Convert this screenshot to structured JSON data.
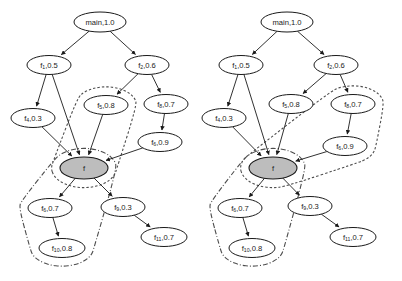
{
  "figure": {
    "type": "call-graph-diagram",
    "background_color": "#ffffff",
    "edge_color": "#1a1a1a",
    "node_fill": "#ffffff",
    "node_stroke": "#1a1a1a",
    "highlight_node_fill": "#bdbdbd",
    "contour_color": "#4d4d4d",
    "panels": [
      {
        "id": "left-panel",
        "name": "left-call-graph",
        "nodes": [
          {
            "id": "main",
            "label": "main,1.0",
            "base": "main",
            "sub": "",
            "value": "1.0",
            "cx": 100,
            "cy": 22,
            "rx": 26,
            "ry": 10,
            "shaded": false
          },
          {
            "id": "f1",
            "label": "f1,0.5",
            "base": "f",
            "sub": "1",
            "value": "0.5",
            "cx": 49,
            "cy": 65,
            "rx": 22,
            "ry": 9.5,
            "shaded": false
          },
          {
            "id": "f2",
            "label": "f2,0.6",
            "base": "f",
            "sub": "2",
            "value": "0.6",
            "cx": 147,
            "cy": 65,
            "rx": 22,
            "ry": 9.5,
            "shaded": false
          },
          {
            "id": "f4",
            "label": "f4,0.3",
            "base": "f",
            "sub": "4",
            "value": "0.3",
            "cx": 33,
            "cy": 118,
            "rx": 22,
            "ry": 9.5,
            "shaded": false
          },
          {
            "id": "f5",
            "label": "f5,0.8",
            "base": "f",
            "sub": "5",
            "value": "0.8",
            "cx": 106,
            "cy": 105,
            "rx": 22,
            "ry": 9.5,
            "shaded": false
          },
          {
            "id": "f8",
            "label": "f8,0.7",
            "base": "f",
            "sub": "8",
            "value": "0.7",
            "cx": 166,
            "cy": 104,
            "rx": 22,
            "ry": 9.5,
            "shaded": false
          },
          {
            "id": "f6",
            "label": "f6,0.9",
            "base": "f",
            "sub": "6",
            "value": "0.9",
            "cx": 160,
            "cy": 142,
            "rx": 22,
            "ry": 9.5,
            "shaded": false
          },
          {
            "id": "f",
            "label": "f",
            "base": "f",
            "sub": "",
            "value": "",
            "cx": 84,
            "cy": 168,
            "rx": 24,
            "ry": 11,
            "shaded": true
          },
          {
            "id": "f6b",
            "label": "f6,0.7",
            "base": "f",
            "sub": "6",
            "value": "0.7",
            "cx": 50,
            "cy": 208,
            "rx": 22,
            "ry": 9.5,
            "shaded": false
          },
          {
            "id": "f9",
            "label": "f9,0.3",
            "base": "f",
            "sub": "9",
            "value": "0.3",
            "cx": 123,
            "cy": 207,
            "rx": 22,
            "ry": 9.5,
            "shaded": false
          },
          {
            "id": "f10",
            "label": "f10,0.8",
            "base": "f",
            "sub": "10",
            "value": "0.8",
            "cx": 62,
            "cy": 248,
            "rx": 23,
            "ry": 9.5,
            "shaded": false
          },
          {
            "id": "f11",
            "label": "f11,0.7",
            "base": "f",
            "sub": "11",
            "value": "0.7",
            "cx": 164,
            "cy": 237,
            "rx": 23,
            "ry": 9.5,
            "shaded": false
          }
        ],
        "edges": [
          {
            "from": "main",
            "to": "f1"
          },
          {
            "from": "main",
            "to": "f2"
          },
          {
            "from": "f1",
            "to": "f4"
          },
          {
            "from": "f1",
            "to": "f"
          },
          {
            "from": "f2",
            "to": "f5"
          },
          {
            "from": "f2",
            "to": "f8"
          },
          {
            "from": "f5",
            "to": "f"
          },
          {
            "from": "f8",
            "to": "f6"
          },
          {
            "from": "f4",
            "to": "f"
          },
          {
            "from": "f6",
            "to": "f"
          },
          {
            "from": "f",
            "to": "f6b"
          },
          {
            "from": "f",
            "to": "f9"
          },
          {
            "from": "f6b",
            "to": "f10"
          },
          {
            "from": "f9",
            "to": "f11"
          }
        ],
        "contours": [
          {
            "style": "dashed",
            "name": "dashed-region",
            "encloses": [
              "f5",
              "f"
            ]
          },
          {
            "style": "dashdot",
            "name": "dashdot-region",
            "encloses": [
              "f",
              "f6b",
              "f10"
            ]
          }
        ]
      },
      {
        "id": "right-panel",
        "name": "right-call-graph",
        "nodes": [
          {
            "id": "main",
            "label": "main,1.0",
            "base": "main",
            "sub": "",
            "value": "1.0",
            "cx": 287,
            "cy": 22,
            "rx": 26,
            "ry": 10,
            "shaded": false
          },
          {
            "id": "f1",
            "label": "f1,0.5",
            "base": "f",
            "sub": "1",
            "value": "0.5",
            "cx": 241,
            "cy": 65,
            "rx": 22,
            "ry": 9.5,
            "shaded": false
          },
          {
            "id": "f2",
            "label": "f2,0.6",
            "base": "f",
            "sub": "2",
            "value": "0.6",
            "cx": 336,
            "cy": 65,
            "rx": 22,
            "ry": 9.5,
            "shaded": false
          },
          {
            "id": "f4",
            "label": "f4,0.3",
            "base": "f",
            "sub": "4",
            "value": "0.3",
            "cx": 224,
            "cy": 118,
            "rx": 22,
            "ry": 9.5,
            "shaded": false
          },
          {
            "id": "f5",
            "label": "f5,0.8",
            "base": "f",
            "sub": "5",
            "value": "0.8",
            "cx": 291,
            "cy": 104,
            "rx": 22,
            "ry": 9.5,
            "shaded": false
          },
          {
            "id": "f8",
            "label": "f8,0.7",
            "base": "f",
            "sub": "8",
            "value": "0.7",
            "cx": 353,
            "cy": 104,
            "rx": 22,
            "ry": 9.5,
            "shaded": false
          },
          {
            "id": "f6",
            "label": "f6,0.9",
            "base": "f",
            "sub": "6",
            "value": "0.9",
            "cx": 345,
            "cy": 146,
            "rx": 22,
            "ry": 9.5,
            "shaded": false
          },
          {
            "id": "f",
            "label": "f",
            "base": "f",
            "sub": "",
            "value": "",
            "cx": 273,
            "cy": 168,
            "rx": 24,
            "ry": 11,
            "shaded": true
          },
          {
            "id": "f6b",
            "label": "f6,0.7",
            "base": "f",
            "sub": "6",
            "value": "0.7",
            "cx": 240,
            "cy": 208,
            "rx": 22,
            "ry": 9.5,
            "shaded": false
          },
          {
            "id": "f9",
            "label": "f9,0.3",
            "base": "f",
            "sub": "9",
            "value": "0.3",
            "cx": 310,
            "cy": 206,
            "rx": 22,
            "ry": 9.5,
            "shaded": false
          },
          {
            "id": "f10",
            "label": "f10,0.8",
            "base": "f",
            "sub": "10",
            "value": "0.8",
            "cx": 252,
            "cy": 248,
            "rx": 23,
            "ry": 9.5,
            "shaded": false
          },
          {
            "id": "f11",
            "label": "f11,0.7",
            "base": "f",
            "sub": "11",
            "value": "0.7",
            "cx": 353,
            "cy": 237,
            "rx": 23,
            "ry": 9.5,
            "shaded": false
          }
        ],
        "edges": [
          {
            "from": "main",
            "to": "f1"
          },
          {
            "from": "main",
            "to": "f2"
          },
          {
            "from": "f1",
            "to": "f4"
          },
          {
            "from": "f1",
            "to": "f"
          },
          {
            "from": "f2",
            "to": "f5"
          },
          {
            "from": "f2",
            "to": "f8"
          },
          {
            "from": "f5",
            "to": "f"
          },
          {
            "from": "f8",
            "to": "f6"
          },
          {
            "from": "f4",
            "to": "f"
          },
          {
            "from": "f6",
            "to": "f"
          },
          {
            "from": "f",
            "to": "f6b"
          },
          {
            "from": "f",
            "to": "f9"
          },
          {
            "from": "f6b",
            "to": "f10"
          },
          {
            "from": "f9",
            "to": "f11"
          }
        ],
        "contours": [
          {
            "style": "dashed",
            "name": "dashed-region",
            "encloses": [
              "f8",
              "f6",
              "f"
            ]
          },
          {
            "style": "dashdot",
            "name": "dashdot-region",
            "encloses": [
              "f",
              "f6b",
              "f10"
            ]
          }
        ]
      }
    ]
  }
}
